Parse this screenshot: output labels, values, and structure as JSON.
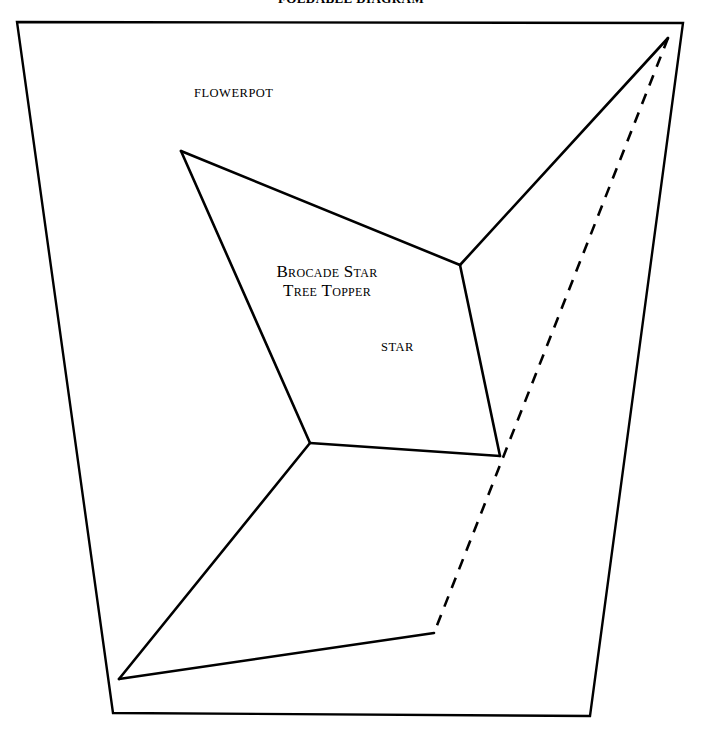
{
  "document": {
    "title": "Foldable Diagram",
    "title_visible_fragment": "FOLDABLE DIAGRAM"
  },
  "labels": {
    "flowerpot": "FLOWERPOT",
    "star": "STAR",
    "project_title_line1": "Brocade Star",
    "project_title_line2": "Tree Topper"
  },
  "colors": {
    "background": "#ffffff",
    "stroke": "#000000",
    "text": "#000000"
  },
  "figure": {
    "type": "line-diagram",
    "stroke_width_outer": 2.4,
    "stroke_width_inner": 2.6,
    "dash_pattern": "11 9",
    "outer_border": [
      [
        17,
        22
      ],
      [
        683,
        23
      ],
      [
        590,
        716
      ],
      [
        113,
        713
      ]
    ],
    "star_vertices": {
      "top_point": [
        181,
        151
      ],
      "right_apex": [
        668,
        38
      ],
      "bottom_left_point": [
        119,
        679
      ],
      "dash_foot": [
        434,
        633
      ],
      "hub_upper_right": [
        460,
        265
      ],
      "hub_center_left": [
        310,
        443
      ],
      "hub_lower_right": [
        500,
        456
      ]
    },
    "solid_edges": [
      [
        [
          181,
          151
        ],
        [
          460,
          265
        ]
      ],
      [
        [
          460,
          265
        ],
        [
          668,
          38
        ]
      ],
      [
        [
          460,
          265
        ],
        [
          500,
          456
        ]
      ],
      [
        [
          500,
          456
        ],
        [
          310,
          443
        ]
      ],
      [
        [
          310,
          443
        ],
        [
          181,
          151
        ]
      ],
      [
        [
          310,
          443
        ],
        [
          119,
          679
        ]
      ],
      [
        [
          119,
          679
        ],
        [
          434,
          633
        ]
      ]
    ],
    "dashed_edges": [
      [
        [
          668,
          38
        ],
        [
          434,
          633
        ]
      ]
    ]
  }
}
